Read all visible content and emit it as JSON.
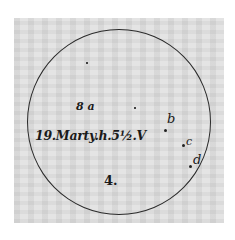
{
  "figure": {
    "caption": "19.Marty.h.5½.V",
    "spot_labels": {
      "a": "8 a",
      "b": "b",
      "c": "c",
      "d": "d",
      "four": "4."
    }
  }
}
